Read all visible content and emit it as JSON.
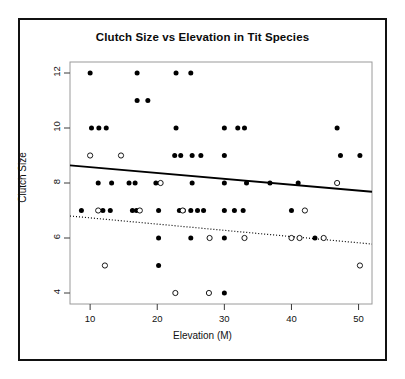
{
  "figure": {
    "border_color": "#111111",
    "background": "#ffffff"
  },
  "chart_data": {
    "type": "scatter",
    "title": "Clutch Size vs Elevation in Tit Species",
    "xlabel": "Elevation (M)",
    "ylabel": "Clutch Size",
    "xlim": [
      7.0,
      52.0
    ],
    "ylim": [
      3.6,
      12.4
    ],
    "xticks": [
      10,
      20,
      30,
      40,
      50
    ],
    "yticks": [
      4,
      6,
      8,
      10,
      12
    ],
    "grid": false,
    "legend": "none",
    "series": [
      {
        "name": "filled",
        "marker": "filled-circle",
        "color": "#000000",
        "points": [
          [
            10.0,
            12
          ],
          [
            17.0,
            12
          ],
          [
            22.8,
            12
          ],
          [
            25.0,
            12
          ],
          [
            17.0,
            11
          ],
          [
            18.6,
            11
          ],
          [
            10.2,
            10
          ],
          [
            11.3,
            10
          ],
          [
            12.4,
            10
          ],
          [
            22.8,
            10
          ],
          [
            30.0,
            10
          ],
          [
            32.0,
            10
          ],
          [
            33.0,
            10
          ],
          [
            46.8,
            10
          ],
          [
            22.6,
            9
          ],
          [
            23.5,
            9
          ],
          [
            25.2,
            9
          ],
          [
            26.5,
            9
          ],
          [
            30.0,
            9
          ],
          [
            47.3,
            9
          ],
          [
            50.2,
            9
          ],
          [
            11.2,
            8
          ],
          [
            13.2,
            8
          ],
          [
            15.8,
            8
          ],
          [
            16.7,
            8
          ],
          [
            19.8,
            8
          ],
          [
            25.2,
            8
          ],
          [
            30.0,
            8
          ],
          [
            33.3,
            8
          ],
          [
            36.8,
            8
          ],
          [
            41.0,
            8
          ],
          [
            8.7,
            7
          ],
          [
            11.9,
            7
          ],
          [
            13.0,
            7
          ],
          [
            16.3,
            7
          ],
          [
            16.9,
            7
          ],
          [
            20.2,
            7
          ],
          [
            23.3,
            7
          ],
          [
            23.9,
            7
          ],
          [
            25.0,
            7
          ],
          [
            26.0,
            7
          ],
          [
            26.9,
            7
          ],
          [
            30.0,
            7
          ],
          [
            31.5,
            7
          ],
          [
            32.8,
            7
          ],
          [
            40.0,
            7
          ],
          [
            20.2,
            6
          ],
          [
            25.0,
            6
          ],
          [
            30.0,
            6
          ],
          [
            43.5,
            6
          ],
          [
            20.2,
            5
          ],
          [
            30.0,
            4
          ]
        ]
      },
      {
        "name": "open",
        "marker": "open-circle",
        "color": "#000000",
        "points": [
          [
            10.0,
            9
          ],
          [
            14.6,
            9
          ],
          [
            20.5,
            8
          ],
          [
            46.8,
            8
          ],
          [
            11.2,
            7
          ],
          [
            17.4,
            7
          ],
          [
            23.8,
            7
          ],
          [
            42.0,
            7
          ],
          [
            27.8,
            6
          ],
          [
            33.0,
            6
          ],
          [
            40.0,
            6
          ],
          [
            41.2,
            6
          ],
          [
            44.8,
            6
          ],
          [
            12.2,
            5
          ],
          [
            50.2,
            5
          ],
          [
            22.7,
            4
          ],
          [
            27.7,
            4
          ]
        ]
      }
    ],
    "trendlines": [
      {
        "name": "solid-regression-line",
        "style": "solid",
        "color": "#000000",
        "x0": 7.0,
        "y0": 8.64,
        "x1": 52.0,
        "y1": 7.68
      },
      {
        "name": "dotted-regression-line",
        "style": "dotted",
        "color": "#000000",
        "x0": 7.0,
        "y0": 6.8,
        "x1": 52.0,
        "y1": 5.78
      }
    ]
  }
}
